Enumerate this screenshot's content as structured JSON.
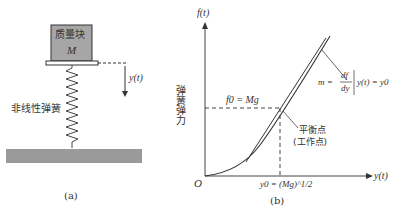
{
  "panel_a": {
    "mass_label": "质量块",
    "mass_symbol": "M",
    "displacement_label": "y(t)",
    "spring_label": "非线性弹簧",
    "caption": "(a)"
  },
  "panel_b": {
    "y_axis_label": "f(t)",
    "y_axis_title": "弹簧弹力",
    "x_axis_label": "y(t)",
    "origin_label": "O",
    "f0_label": "f0 = Mg",
    "y0_label": "y0 = (Mg)^1/2",
    "slope_label_m": "m =",
    "slope_num": "df",
    "slope_den": "dy",
    "slope_cond": "y(t) = y0",
    "eq_point_line1": "平衡点",
    "eq_point_line2": "(工作点)",
    "caption": "(b)"
  },
  "colors": {
    "mass_fill": "#a6a6a6",
    "ground_fill": "#9a9a9a",
    "line": "#333333"
  }
}
